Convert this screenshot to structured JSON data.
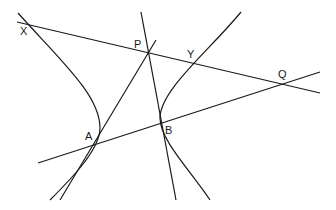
{
  "diagram": {
    "stroke_color": "#1a1a1a",
    "background": "#ffffff",
    "points": {
      "X": {
        "label": "X",
        "x": 31,
        "y": 25
      },
      "P": {
        "label": "P",
        "x": 148,
        "y": 53
      },
      "Y": {
        "label": "Y",
        "x": 194,
        "y": 64
      },
      "Q": {
        "label": "Q",
        "x": 283,
        "y": 84
      },
      "A": {
        "label": "A",
        "x": 92,
        "y": 145
      },
      "B": {
        "label": "B",
        "x": 161,
        "y": 124
      }
    },
    "lines": [
      {
        "name": "line-XPYQ",
        "from": [
          17,
          22
        ],
        "to": [
          320,
          93
        ]
      },
      {
        "name": "line-AQ",
        "from": [
          38,
          163
        ],
        "to": [
          320,
          72
        ]
      },
      {
        "name": "tangent-at-A",
        "from": [
          60,
          200
        ],
        "to": [
          156,
          40
        ]
      },
      {
        "name": "tangent-at-B",
        "from": [
          141,
          12
        ],
        "to": [
          176,
          200
        ]
      }
    ],
    "curves": [
      {
        "name": "left-hyperbola-branch",
        "path": "M18,13 C60,60 100,95 100,128 C100,150 70,180 50,200"
      },
      {
        "name": "right-hyperbola-branch",
        "path": "M241,12 C210,50 160,90 160,118 C160,140 190,170 210,200"
      }
    ]
  }
}
